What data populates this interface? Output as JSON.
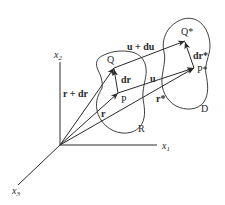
{
  "diagram": {
    "type": "continuum deformation vector diagram",
    "axes": {
      "x1": {
        "label": "x",
        "sub": "1"
      },
      "x2": {
        "label": "x",
        "sub": "2"
      },
      "x3": {
        "label": "x",
        "sub": "3"
      }
    },
    "points": {
      "Q": "Q",
      "P": "P",
      "Q_star": "Q*",
      "P_star": "P*"
    },
    "vectors": {
      "r": "r",
      "r_plus_dr": "r + dr",
      "dr": "dr",
      "u": "u",
      "u_plus_du": "u + du",
      "r_star": "r*",
      "dr_star": "dr*"
    },
    "regions": {
      "R": "R",
      "D": "D"
    },
    "colors": {
      "stroke": "#2a2a2a",
      "background": "#ffffff"
    }
  }
}
